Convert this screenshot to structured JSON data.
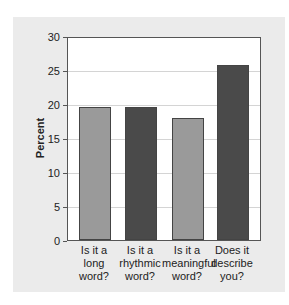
{
  "chart_data": {
    "type": "bar",
    "title": "",
    "xlabel": "",
    "ylabel": "Percent",
    "ylim": [
      0,
      30
    ],
    "yticks": [
      0,
      5,
      10,
      15,
      20,
      25,
      30
    ],
    "grid": true,
    "legend": null,
    "categories": [
      "Is it a long word?",
      "Is it a rhythmic word?",
      "Is it a meaningful word?",
      "Does it describe you?"
    ],
    "category_lines": [
      [
        "Is it a",
        "long",
        "word?"
      ],
      [
        "Is it a",
        "rhythmic",
        "word?"
      ],
      [
        "Is it a",
        "meaningful",
        "word?"
      ],
      [
        "Does it",
        "describe",
        "you?"
      ]
    ],
    "values": [
      19.5,
      19.6,
      18.0,
      25.7
    ],
    "bar_colors": [
      "#9a9a9a",
      "#4a4a4a",
      "#9a9a9a",
      "#4a4a4a"
    ]
  },
  "colors": {
    "panel_background": "#ebebeb",
    "plot_background": "#ffffff",
    "gridline": "#d4d4d4",
    "light_bar": "#9a9a9a",
    "dark_bar": "#4a4a4a"
  }
}
